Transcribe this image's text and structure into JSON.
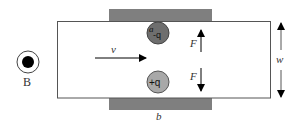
{
  "diagram": {
    "title": "",
    "colors": {
      "background": "#ffffff",
      "outline": "#555555",
      "plate": "#7f7f7f",
      "negative_charge": "#6e6e6e",
      "positive_charge": "#a8a8a8",
      "arrow": "#000000",
      "text": "#333333"
    },
    "field": {
      "symbol_icon": "field-out-of-page-icon",
      "label": "B"
    },
    "velocity": {
      "label": "v"
    },
    "charges": [
      {
        "label": "-q",
        "prefix": "a",
        "sign": "negative"
      },
      {
        "label": "+q",
        "sign": "positive"
      }
    ],
    "forces": [
      {
        "label": "F",
        "direction": "up"
      },
      {
        "label": "F",
        "direction": "down"
      }
    ],
    "dimensions": {
      "width_label": "w",
      "plate_length_label": "b"
    }
  }
}
